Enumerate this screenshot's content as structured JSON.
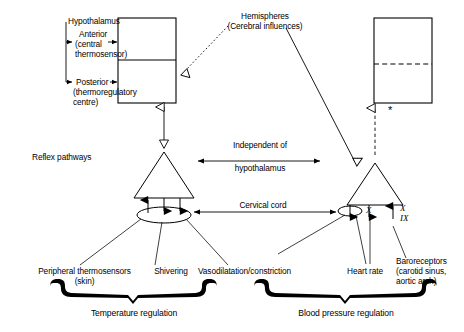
{
  "diagram": {
    "type": "physiology-flow-diagram"
  },
  "labels": {
    "hypothalamus": "Hypothalamus",
    "anterior": "Anterior\n(central\nthermosensor)",
    "anterior_line1": "Anterior",
    "anterior_line2": "(central",
    "anterior_line3": "thermosensor)",
    "posterior_line1": "Posterior",
    "posterior_line2": "(thermoregulatory",
    "posterior_line3": "centre)",
    "hemispheres_line1": "Hemispheres",
    "hemispheres_line2": "(Cerebral influences)",
    "reflex_pathways": "Reflex pathways",
    "independent_line1": "Independent of",
    "independent_line2": "hypothalamus",
    "cervical_cord": "Cervical cord",
    "peripheral_line1": "Peripheral thermosensors",
    "peripheral_line2": "(skin)",
    "shivering": "Shivering",
    "vasodilatation": "Vasodilatation/constriction",
    "heart_rate": "Heart rate",
    "baroreceptors_line1": "Baroreceptors",
    "baroreceptors_line2": "(carotid sinus,",
    "baroreceptors_line3": "aortic arch)",
    "temperature_regulation": "Temperature regulation",
    "blood_pressure_regulation": "Blood pressure regulation",
    "nerve_x_left": "X",
    "nerve_x_right": "X",
    "nerve_ix_right": "IX",
    "asterisk": "*"
  },
  "colors": {
    "stroke": "#000000",
    "background": "#ffffff",
    "text": "#000000"
  },
  "nodes": [
    {
      "name": "hypothalamus-box",
      "shape": "rectangle-divided",
      "x": 118,
      "y": 18,
      "w": 58,
      "h": 85
    },
    {
      "name": "spinal-cord-box",
      "shape": "rectangle-dashed-divider",
      "x": 374,
      "y": 18,
      "w": 58,
      "h": 85
    },
    {
      "name": "left-triangle",
      "shape": "triangle",
      "cx": 164,
      "cy": 175
    },
    {
      "name": "right-triangle",
      "shape": "triangle",
      "cx": 375,
      "cy": 175
    },
    {
      "name": "left-ellipse",
      "shape": "ellipse",
      "cx": 164,
      "cy": 215
    },
    {
      "name": "right-ellipse",
      "shape": "ellipse",
      "cx": 350,
      "cy": 211
    }
  ]
}
